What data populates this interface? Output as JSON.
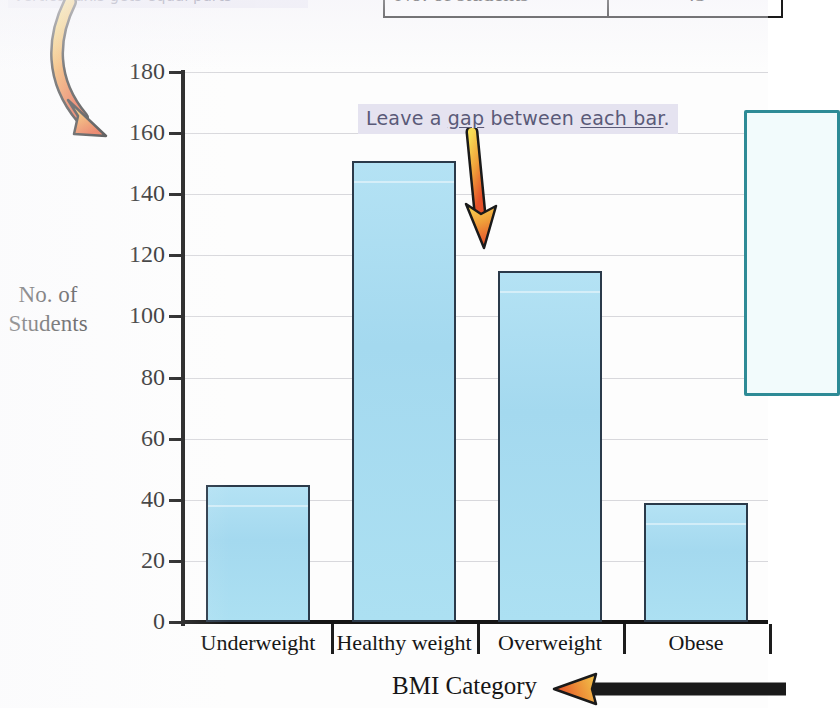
{
  "annotations": {
    "top_left_note": "vertical axis gets equal parts",
    "gap_note_prefix": "Leave a ",
    "gap_note_word1": "gap",
    "gap_note_middle": " between ",
    "gap_note_word2": "each bar",
    "gap_note_suffix": ".",
    "gap_note_full": "Leave a gap between each bar.",
    "arrow_curved_name": "curved-arrow-to-axis-label",
    "arrow_down_name": "down-arrow-to-bar-gap",
    "arrow_right_name": "left-pointing-arrow-to-x-axis-title"
  },
  "table": {
    "rows": [
      {
        "label": "No. of students",
        "value": "45"
      }
    ]
  },
  "chart_data": {
    "type": "bar",
    "title": "",
    "categories": [
      "Underweight",
      "Healthy weight",
      "Overweight",
      "Obese"
    ],
    "values": [
      45,
      151,
      115,
      39
    ],
    "xlabel": "BMI Category",
    "ylabel": "No. of Students",
    "ylabel_line1": "No. of",
    "ylabel_line2": "Students",
    "ylim": [
      0,
      180
    ],
    "ytick_step": 20,
    "yticks": [
      0,
      20,
      40,
      60,
      80,
      100,
      120,
      140,
      160,
      180
    ],
    "ytick_labels": [
      "0",
      "20",
      "40",
      "60",
      "80",
      "100",
      "120",
      "140",
      "160",
      "180"
    ],
    "grid": true,
    "legend": false,
    "bar_color": "#a8ddf0",
    "bar_border_color": "#2b3a4a",
    "axis_color": "#151515",
    "grid_color": "#d8d8dc"
  },
  "side_box": {
    "border_color": "#2e8b96",
    "fill_color": "#f2fbfc"
  },
  "colors": {
    "highlight": "#e5e3f0",
    "note_text": "#5a5a78",
    "arrow_start": "#f5d24a",
    "arrow_end": "#e2562a"
  }
}
